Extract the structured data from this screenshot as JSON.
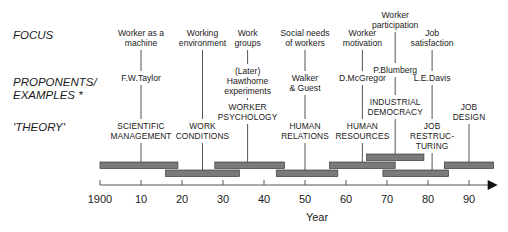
{
  "row_labels": {
    "focus": "FOCUS",
    "proponents_line1": "PROPONENTS/",
    "proponents_line2": "EXAMPLES *",
    "theory": "'THEORY'"
  },
  "axis": {
    "label": "Year",
    "ticks": [
      "1900",
      "10",
      "20",
      "30",
      "40",
      "50",
      "60",
      "70",
      "80",
      "90"
    ],
    "tick_years": [
      1900,
      1910,
      1920,
      1930,
      1940,
      1950,
      1960,
      1970,
      1980,
      1990
    ],
    "range": [
      1900,
      1997
    ]
  },
  "eras": [
    {
      "focus": [
        "Worker as a",
        "machine"
      ],
      "proponent": [
        "F.W.Taylor"
      ],
      "theory": [
        "SCIENTIFIC",
        "MANAGEMENT"
      ],
      "start": 1900,
      "end": 1919,
      "center": 1910,
      "row": 0
    },
    {
      "focus": [
        "Working",
        "environment"
      ],
      "proponent": [],
      "theory": [
        "WORK",
        "CONDITIONS"
      ],
      "start": 1916,
      "end": 1934,
      "center": 1925,
      "row": 1
    },
    {
      "focus": [
        "Work",
        "groups"
      ],
      "proponent": [
        "(Later)",
        "Hawthorne",
        "experiments"
      ],
      "theory": [
        "WORKER",
        "PSYCHOLOGY"
      ],
      "start": 1928,
      "end": 1945,
      "center": 1936,
      "row": 0
    },
    {
      "focus": [
        "Social needs",
        "of workers"
      ],
      "proponent": [
        "Walker",
        "& Guest"
      ],
      "theory": [
        "HUMAN",
        "RELATIONS"
      ],
      "start": 1943,
      "end": 1958,
      "center": 1950,
      "row": 1
    },
    {
      "focus": [
        "Worker",
        "motivation"
      ],
      "proponent": [
        "D.McGregor"
      ],
      "theory": [
        "HUMAN",
        "RESOURCES"
      ],
      "start": 1956,
      "end": 1972,
      "center": 1964,
      "row": 0
    },
    {
      "focus": [
        "Worker",
        "participation"
      ],
      "proponent": [
        "P.Blumberg"
      ],
      "theory": [
        "INDUSTRIAL",
        "DEMOCRACY"
      ],
      "start": 1965,
      "end": 1979,
      "center": 1972,
      "row": 2
    },
    {
      "focus": [
        "Job",
        "satisfaction"
      ],
      "proponent": [
        "L.E.Davis"
      ],
      "theory": [
        "JOB",
        "RESTRUC-",
        "TURING"
      ],
      "start": 1969,
      "end": 1985,
      "center": 1981,
      "row": 1
    },
    {
      "focus": [],
      "proponent": [],
      "theory": [
        "JOB",
        "DESIGN"
      ],
      "start": 1984,
      "end": 1996,
      "center": 1990,
      "row": 0
    }
  ],
  "colors": {
    "bar_fill": "#7a7a7a",
    "bar_stroke": "#3a3a3a",
    "line": "#555555",
    "text": "#222222"
  }
}
